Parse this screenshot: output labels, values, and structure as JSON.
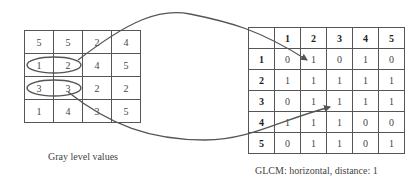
{
  "gray_level": {
    "caption": "Gray level values",
    "rows": [
      [
        "5",
        "5",
        "2",
        "4"
      ],
      [
        "1",
        "2",
        "4",
        "5"
      ],
      [
        "3",
        "3",
        "2",
        "2"
      ],
      [
        "1",
        "4",
        "3",
        "5"
      ]
    ],
    "highlighted_pairs": [
      {
        "row": 1,
        "cols": [
          0,
          1
        ],
        "pair": "(1,2)"
      },
      {
        "row": 2,
        "cols": [
          0,
          1
        ],
        "pair": "(3,3)"
      }
    ]
  },
  "glcm": {
    "caption": "GLCM: horizontal, distance: 1",
    "corner": "",
    "column_headers": [
      "1",
      "2",
      "3",
      "4",
      "5"
    ],
    "row_headers": [
      "1",
      "2",
      "3",
      "4",
      "5"
    ],
    "rows": [
      [
        "0",
        "1",
        "0",
        "1",
        "0"
      ],
      [
        "1",
        "1",
        "1",
        "1",
        "1"
      ],
      [
        "0",
        "1",
        "1",
        "1",
        "1"
      ],
      [
        "1",
        "1",
        "1",
        "0",
        "0"
      ],
      [
        "0",
        "1",
        "1",
        "0",
        "1"
      ]
    ]
  },
  "arrows": [
    {
      "from": "gray pair (1,2)",
      "to": "GLCM row 1, col 2"
    },
    {
      "from": "gray pair (3,3)",
      "to": "GLCM row 3, col 3"
    }
  ],
  "colors": {
    "line": "#555555",
    "text": "#444444"
  }
}
